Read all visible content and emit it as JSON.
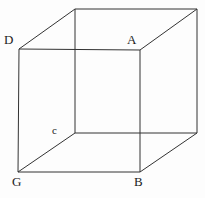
{
  "figure": {
    "name": "cube-wireframe-diagram",
    "background_color": "#fdfdfd",
    "stroke_color": "#333333",
    "stroke_width": 1,
    "width": 205,
    "height": 198
  },
  "labels": {
    "d": "D",
    "a": "A",
    "c": "c",
    "g": "G",
    "b": "B"
  },
  "geometry": {
    "front_face": {
      "top_left": [
        19,
        49
      ],
      "top_right": [
        140,
        50
      ],
      "bottom_right": [
        140,
        172
      ],
      "bottom_left": [
        18,
        172
      ]
    },
    "back_face": {
      "top_left": [
        75,
        9
      ],
      "top_right": [
        197,
        9
      ],
      "bottom_right": [
        197,
        133
      ],
      "bottom_left": [
        75,
        133
      ]
    },
    "edges": [
      "front-top",
      "front-right",
      "front-bottom",
      "front-left",
      "back-top",
      "back-right",
      "back-bottom",
      "back-left",
      "connect-top-left",
      "connect-top-right",
      "connect-bottom-right",
      "connect-bottom-left"
    ]
  }
}
